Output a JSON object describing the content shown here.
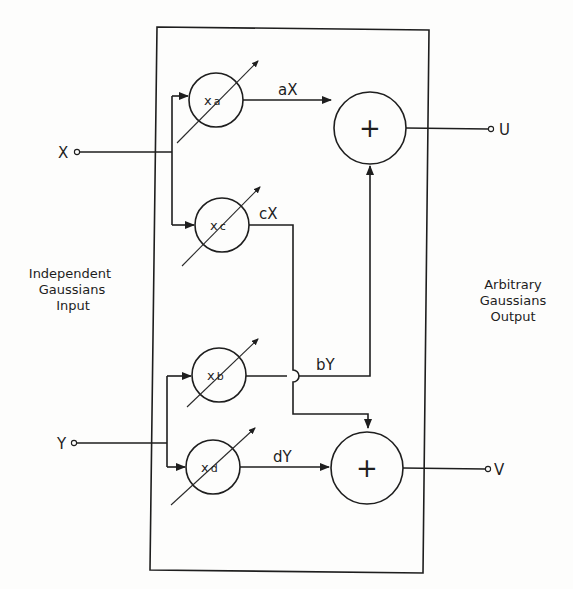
{
  "diagram": {
    "type": "block-diagram",
    "left_caption": [
      "Independent",
      "Gaussians",
      "Input"
    ],
    "right_caption": [
      "Arbitrary",
      "Gaussians",
      "Output"
    ],
    "inputs": [
      {
        "id": "X",
        "label": "X"
      },
      {
        "id": "Y",
        "label": "Y"
      }
    ],
    "outputs": [
      {
        "id": "U",
        "label": "U"
      },
      {
        "id": "V",
        "label": "V"
      }
    ],
    "multipliers": [
      {
        "id": "a",
        "prefix": "x",
        "sub": "a",
        "input": "X",
        "output_label": "aX",
        "adjustable": true
      },
      {
        "id": "c",
        "prefix": "x",
        "sub": "c",
        "input": "X",
        "output_label": "cX",
        "adjustable": true
      },
      {
        "id": "b",
        "prefix": "x",
        "sub": "b",
        "input": "Y",
        "output_label": "bY",
        "adjustable": true
      },
      {
        "id": "d",
        "prefix": "x",
        "sub": "d",
        "input": "Y",
        "output_label": "dY",
        "adjustable": true
      }
    ],
    "summers": [
      {
        "id": "sum_u",
        "symbol": "+",
        "inputs": [
          "aX",
          "bY"
        ],
        "output": "U"
      },
      {
        "id": "sum_v",
        "symbol": "+",
        "inputs": [
          "cX",
          "dY"
        ],
        "output": "V"
      }
    ],
    "stroke_color": "#1e1e1e",
    "background_color": "#fdfdfc"
  }
}
